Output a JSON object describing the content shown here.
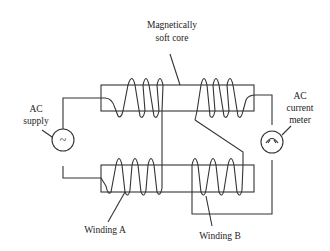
{
  "diagram": {
    "labels": {
      "core_line1": "Magnetically",
      "core_line2": "soft core",
      "supply_line1": "AC",
      "supply_line2": "supply",
      "meter_line1": "AC",
      "meter_line2": "current",
      "meter_line3": "meter",
      "winding_a": "Winding A",
      "winding_b": "Winding B"
    },
    "symbols": {
      "supply_symbol": "~",
      "meter_icon": "ac-ammeter-icon"
    },
    "colors": {
      "line": "#333333",
      "background": "#ffffff"
    }
  }
}
